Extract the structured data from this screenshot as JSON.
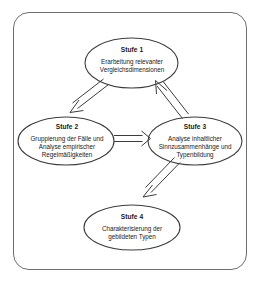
{
  "diagram": {
    "type": "flowchart",
    "title_visible": false,
    "border": {
      "style": "rounded-rectangle",
      "color": "#6e6e6e"
    },
    "text_color": "#1a1a1a",
    "stroke_color": "#3c3c3c",
    "nodes": [
      {
        "id": "stufe1",
        "shape": "ellipse",
        "title": "Stufe 1",
        "lines": [
          "Erarbeitung relevanter",
          "Vergleichsdimensionen"
        ]
      },
      {
        "id": "stufe2",
        "shape": "ellipse",
        "title": "Stufe 2",
        "lines": [
          "Gruppierung der Fälle und",
          "Analyse empirischer",
          "Regelmäßigkeiten"
        ]
      },
      {
        "id": "stufe3",
        "shape": "ellipse",
        "title": "Stufe 3",
        "lines": [
          "Analyse inhaltlicher",
          "Sinnzusammenhänge und",
          "Typenbildung"
        ]
      },
      {
        "id": "stufe4",
        "shape": "ellipse",
        "title": "Stufe 4",
        "lines": [
          "Charakterisierung der",
          "gebildeten Typen"
        ]
      }
    ],
    "edges": [
      {
        "id": "edge-1-2",
        "from": "stufe1",
        "to": "stufe2",
        "style": "open-outline-arrow"
      },
      {
        "id": "edge-2-3",
        "from": "stufe2",
        "to": "stufe3",
        "style": "open-outline-arrow"
      },
      {
        "id": "edge-3-1",
        "from": "stufe3",
        "to": "stufe1",
        "style": "open-outline-arrow"
      },
      {
        "id": "edge-3-4",
        "from": "stufe3",
        "to": "stufe4",
        "style": "open-outline-arrow"
      }
    ]
  }
}
